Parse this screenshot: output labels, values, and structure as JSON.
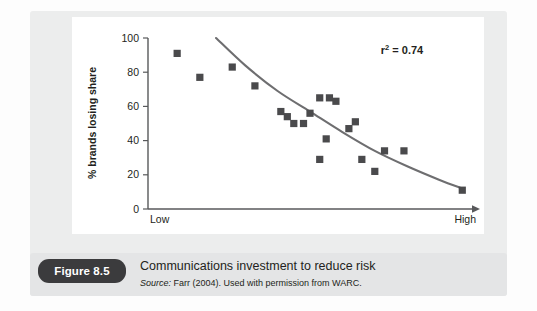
{
  "figure": {
    "badge_label": "Figure 8.5",
    "caption_title": "Communications investment to reduce risk",
    "source_prefix": "Source:",
    "source_text": " Farr (2004). Used with permission from WARC."
  },
  "colors": {
    "panel_background": "#eceded",
    "plot_background": "#ffffff",
    "caption_background": "#e4e5e6",
    "badge_background": "#3b3b3d",
    "marker": "#4a4a4c",
    "trendline": "#6e6e70",
    "axis": "#58595b",
    "text": "#231f20"
  },
  "chart_data": {
    "type": "scatter",
    "title": "",
    "xlabel": "Media pressure",
    "ylabel": "% brands losing share",
    "xlim": [
      0,
      100
    ],
    "ylim": [
      0,
      100
    ],
    "grid": false,
    "legend_position": "none",
    "x_axis_ticklabels": [
      "Low",
      "High"
    ],
    "y_ticks": [
      0,
      20,
      40,
      60,
      80,
      100
    ],
    "y_ticklabels": [
      "0",
      "20",
      "40",
      "60",
      "80",
      "100"
    ],
    "annotation": "r2 = 0.74",
    "annotation_value": 0.74,
    "annotation_symbol": "r",
    "annotation_exponent": "2",
    "annotation_equals": " = 0.74",
    "series": [
      {
        "name": "brands",
        "marker": "square",
        "points": [
          {
            "x": 9,
            "y": 91
          },
          {
            "x": 16,
            "y": 77
          },
          {
            "x": 26,
            "y": 83
          },
          {
            "x": 33,
            "y": 72
          },
          {
            "x": 41,
            "y": 57
          },
          {
            "x": 43,
            "y": 54
          },
          {
            "x": 45,
            "y": 50
          },
          {
            "x": 48,
            "y": 50
          },
          {
            "x": 50,
            "y": 56
          },
          {
            "x": 53,
            "y": 65
          },
          {
            "x": 56,
            "y": 65
          },
          {
            "x": 58,
            "y": 63
          },
          {
            "x": 55,
            "y": 41
          },
          {
            "x": 53,
            "y": 29
          },
          {
            "x": 62,
            "y": 47
          },
          {
            "x": 64,
            "y": 51
          },
          {
            "x": 66,
            "y": 29
          },
          {
            "x": 70,
            "y": 22
          },
          {
            "x": 73,
            "y": 34
          },
          {
            "x": 79,
            "y": 34
          },
          {
            "x": 97,
            "y": 11
          }
        ]
      }
    ],
    "trendline": {
      "type": "exponential-decay",
      "points": [
        {
          "x": 21,
          "y": 100
        },
        {
          "x": 30,
          "y": 84
        },
        {
          "x": 40,
          "y": 69
        },
        {
          "x": 50,
          "y": 57
        },
        {
          "x": 60,
          "y": 45
        },
        {
          "x": 70,
          "y": 34
        },
        {
          "x": 80,
          "y": 25
        },
        {
          "x": 90,
          "y": 17
        },
        {
          "x": 97,
          "y": 12
        }
      ]
    }
  }
}
